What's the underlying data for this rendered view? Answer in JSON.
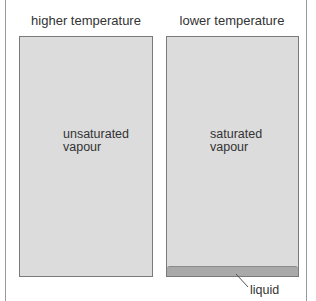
{
  "panels": [
    {
      "heading": "higher temperature",
      "label_line1": "unsaturated",
      "label_line2": "vapour",
      "has_liquid": false
    },
    {
      "heading": "lower temperature",
      "label_line1": "saturated",
      "label_line2": "vapour",
      "has_liquid": true,
      "liquid_label": "liquid"
    }
  ],
  "colors": {
    "vapour_fill": "#dcdcdc",
    "liquid_fill": "#a9a9a9",
    "border": "#7a7a7a"
  }
}
